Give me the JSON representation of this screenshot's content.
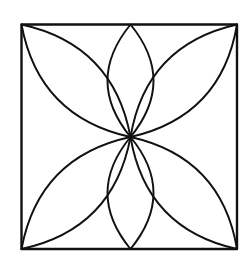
{
  "diagram": {
    "kind": "geometric-rosette",
    "colors": {
      "background": "#ffffff",
      "stroke": "#111111"
    },
    "square": {
      "x": 21.5,
      "y": 24.5,
      "width": 215.5,
      "height": 224.5,
      "stroke_width": 2.4
    },
    "center": {
      "x": 130.5,
      "y": 137
    },
    "petal_stroke_width": 1.9,
    "petals": [
      {
        "name": "petal-top",
        "tip": [
          130.5,
          24.5
        ],
        "bulge": 23
      },
      {
        "name": "petal-bottom",
        "tip": [
          130.5,
          249
        ],
        "bulge": 23
      },
      {
        "name": "petal-top-left",
        "tip": [
          21.5,
          24.5
        ],
        "bulge": 26
      },
      {
        "name": "petal-top-right",
        "tip": [
          237,
          24.5
        ],
        "bulge": 26
      },
      {
        "name": "petal-bottom-left",
        "tip": [
          21.5,
          249
        ],
        "bulge": 26
      },
      {
        "name": "petal-bottom-right",
        "tip": [
          237,
          249
        ],
        "bulge": 26
      }
    ]
  }
}
